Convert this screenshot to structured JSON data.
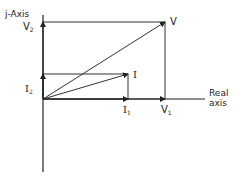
{
  "diagram": {
    "axes": {
      "vertical_label": "j-Axis",
      "horizontal_label_line1": "Real",
      "horizontal_label_line2": "axis"
    },
    "phasors": [
      {
        "name": "V",
        "label": "V",
        "x_component": "V1",
        "y_component": "V2"
      },
      {
        "name": "I",
        "label": "I",
        "x_component": "I1",
        "y_component": "I2"
      }
    ],
    "component_labels": {
      "V2": {
        "main": "V",
        "sub": "2"
      },
      "I2": {
        "main": "I",
        "sub": "2"
      },
      "I1": {
        "main": "I",
        "sub": "1"
      },
      "V1": {
        "main": "V",
        "sub": "1"
      }
    },
    "colors": {
      "line": "#333333",
      "background": "#ffffff"
    }
  }
}
